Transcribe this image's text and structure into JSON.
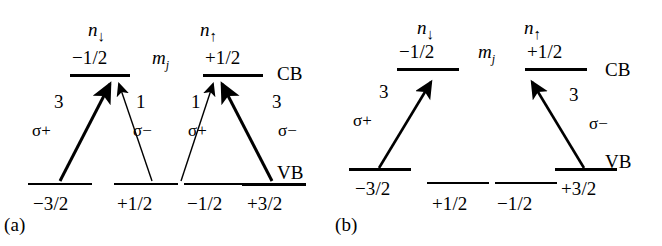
{
  "figure": {
    "type": "energy-level-diagram",
    "background": "#ffffff",
    "ink": "#000000",
    "width": 662,
    "height": 246
  },
  "panels": [
    {
      "id": "a",
      "caption": "(a)",
      "band_labels": {
        "conduction": "CB",
        "valence": "VB"
      },
      "quantum_number_label": "m",
      "quantum_number_sub": "j",
      "spin_populations": [
        {
          "name": "n-down",
          "symbol": "n",
          "arrow": "↓"
        },
        {
          "name": "n-up",
          "symbol": "n",
          "arrow": "↑"
        }
      ],
      "cb_levels": [
        {
          "label": "−1/2",
          "spin": "down"
        },
        {
          "label": "+1/2",
          "spin": "up"
        }
      ],
      "vb_levels": [
        {
          "label": "−3/2"
        },
        {
          "label": "+1/2"
        },
        {
          "label": "−1/2"
        },
        {
          "label": "+3/2"
        }
      ],
      "transitions": [
        {
          "from": "−3/2",
          "to": "−1/2",
          "strength": "3",
          "polarization": "σ+",
          "weight": "strong"
        },
        {
          "from": "+1/2",
          "to": "−1/2",
          "strength": "1",
          "polarization": "σ−",
          "weight": "weak"
        },
        {
          "from": "−1/2",
          "to": "+1/2",
          "strength": "1",
          "polarization": "σ+",
          "weight": "weak"
        },
        {
          "from": "+3/2",
          "to": "+1/2",
          "strength": "3",
          "polarization": "σ−",
          "weight": "strong"
        }
      ]
    },
    {
      "id": "b",
      "caption": "(b)",
      "band_labels": {
        "conduction": "CB",
        "valence": "VB"
      },
      "quantum_number_label": "m",
      "quantum_number_sub": "j",
      "spin_populations": [
        {
          "name": "n-down",
          "symbol": "n",
          "arrow": "↓"
        },
        {
          "name": "n-up",
          "symbol": "n",
          "arrow": "↑"
        }
      ],
      "cb_levels": [
        {
          "label": "−1/2",
          "spin": "down"
        },
        {
          "label": "+1/2",
          "spin": "up"
        }
      ],
      "vb_levels": [
        {
          "label": "−3/2",
          "offset": "upper"
        },
        {
          "label": "+1/2",
          "offset": "lower"
        },
        {
          "label": "−1/2",
          "offset": "lower"
        },
        {
          "label": "+3/2",
          "offset": "upper"
        }
      ],
      "transitions": [
        {
          "from": "−3/2",
          "to": "−1/2",
          "strength": "3",
          "polarization": "σ+",
          "weight": "strong"
        },
        {
          "from": "+3/2",
          "to": "+1/2",
          "strength": "3",
          "polarization": "σ−",
          "weight": "strong"
        }
      ]
    }
  ]
}
